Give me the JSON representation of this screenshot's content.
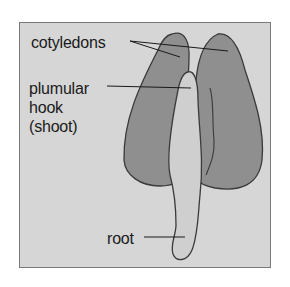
{
  "diagram": {
    "type": "labeled biological illustration",
    "labels": {
      "cotyledons": "cotyledons",
      "plumular_line1": "plumular",
      "plumular_line2": "hook",
      "plumular_line3": "(shoot)",
      "root": "root"
    },
    "colors": {
      "background": "#d6d6d6",
      "cotyledon_fill": "#8f8f8f",
      "shoot_fill": "#cfcfcf",
      "outline": "#3a3a3a",
      "frame_border": "#7a7a7a"
    }
  }
}
